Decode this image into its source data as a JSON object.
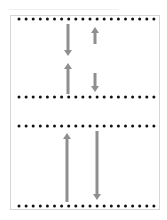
{
  "diagram": {
    "colors": {
      "dot": "#111111",
      "arrow": "#8f8f8f",
      "frame": "#d6d6d6",
      "background": "#ffffff"
    },
    "dot_rows": [
      {
        "name": "top-panel-upper-row",
        "y": 19
      },
      {
        "name": "top-panel-lower-row",
        "y": 97
      },
      {
        "name": "bottom-panel-upper-row",
        "y": 126
      },
      {
        "name": "bottom-panel-lower-row",
        "y": 206
      }
    ],
    "dot_layout": {
      "x_start": 19,
      "x_end": 155,
      "spacing": 7.1,
      "radius": 1.5
    },
    "arrows": [
      {
        "name": "top-left-down-arrow",
        "x": 68,
        "y_from": 24,
        "y_to": 56,
        "direction": "down"
      },
      {
        "name": "top-right-up-arrow",
        "x": 95,
        "y_from": 44,
        "y_to": 27,
        "direction": "up"
      },
      {
        "name": "top-left-up-arrow",
        "x": 68,
        "y_from": 94,
        "y_to": 63,
        "direction": "up"
      },
      {
        "name": "top-right-down-arrow",
        "x": 95,
        "y_from": 73,
        "y_to": 92,
        "direction": "down"
      },
      {
        "name": "bottom-left-up-arrow",
        "x": 67,
        "y_from": 202,
        "y_to": 133,
        "direction": "up"
      },
      {
        "name": "bottom-right-down-arrow",
        "x": 97,
        "y_from": 131,
        "y_to": 200,
        "direction": "down"
      }
    ]
  }
}
